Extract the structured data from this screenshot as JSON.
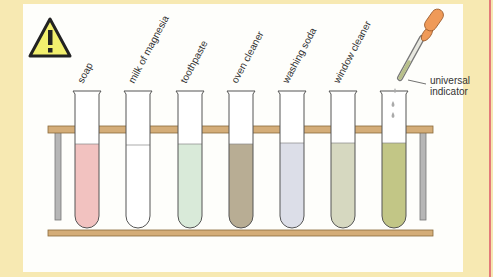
{
  "warning_icon": "warning-triangle-icon",
  "tubes": [
    {
      "label": "soap",
      "color": "#f2c2c0",
      "fill_top": 144
    },
    {
      "label": "milk of magnesia",
      "color": "#ffffff",
      "fill_top": 145
    },
    {
      "label": "toothpaste",
      "color": "#d9ead9",
      "fill_top": 144
    },
    {
      "label": "oven cleaner",
      "color": "#b8ad94",
      "fill_top": 144
    },
    {
      "label": "washing soda",
      "color": "#dcdee8",
      "fill_top": 143
    },
    {
      "label": "window cleaner",
      "color": "#d6d8c0",
      "fill_top": 143
    },
    {
      "label": "",
      "color": "#c2c686",
      "fill_top": 143
    }
  ],
  "dropper_label_line1": "universal",
  "dropper_label_line2": "indicator",
  "colors": {
    "background": "#f7e9b2",
    "rack": "#d4ad78",
    "dropper_bulb": "#ef9a58"
  }
}
